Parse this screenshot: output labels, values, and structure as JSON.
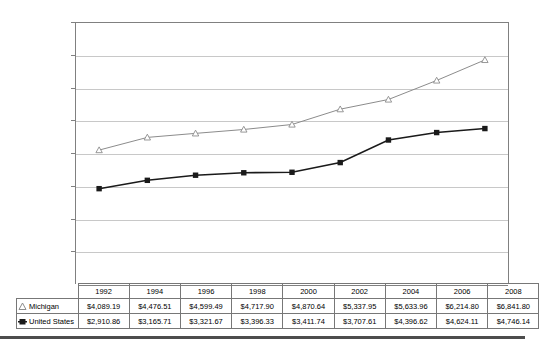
{
  "chart_data": {
    "type": "line",
    "title": "",
    "xlabel": "",
    "ylabel": "",
    "ylim": [
      0,
      8000
    ],
    "ytick_step": 1000,
    "grid": true,
    "legend_position": "table-left",
    "categories": [
      "1992",
      "1994",
      "1996",
      "1998",
      "2000",
      "2002",
      "2004",
      "2006",
      "2008"
    ],
    "ytick_labels": [
      "$0",
      "$1,000",
      "$2,000",
      "$3,000",
      "$4,000",
      "$5,000",
      "$6,000",
      "$7,000",
      "$8,000"
    ],
    "ytick_values": [
      0,
      1000,
      2000,
      3000,
      4000,
      5000,
      6000,
      7000,
      8000
    ],
    "series": [
      {
        "name": "Michigan",
        "marker": "open-triangle",
        "color": "#8c8c8c",
        "values": [
          4089.19,
          4476.51,
          4599.49,
          4717.9,
          4870.64,
          5337.95,
          5633.96,
          6214.8,
          6841.8
        ],
        "labels": [
          "$4,089.19",
          "$4,476.51",
          "$4,599.49",
          "$4,717.90",
          "$4,870.64",
          "$5,337.95",
          "$5,633.96",
          "$6,214.80",
          "$6,841.80"
        ]
      },
      {
        "name": "United States",
        "marker": "filled-square",
        "color": "#1a1a1a",
        "values": [
          2910.86,
          3165.71,
          3321.67,
          3396.33,
          3411.74,
          3707.61,
          4396.62,
          4624.11,
          4746.14
        ],
        "labels": [
          "$2,910.86",
          "$3,165.71",
          "$3,321.67",
          "$3,396.33",
          "$3,411.74",
          "$3,707.61",
          "$4,396.62",
          "$4,624.11",
          "$4,746.14"
        ]
      }
    ]
  },
  "table": {
    "header_corner": "",
    "row_label_michigan": "Michigan",
    "row_label_united_states": "United States"
  },
  "colors": {
    "michigan_line": "#8c8c8c",
    "united_states_line": "#1a1a1a",
    "gridline": "#c8c8c8",
    "axis": "#808080",
    "table_border": "#777777"
  }
}
